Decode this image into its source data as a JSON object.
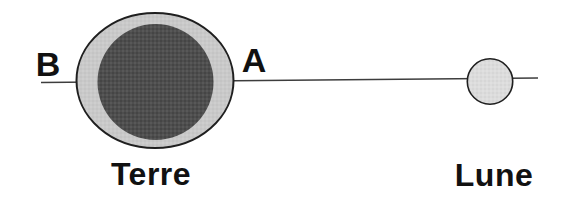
{
  "diagram": {
    "labels": {
      "point_b": "B",
      "point_a": "A",
      "earth": "Terre",
      "moon": "Lune"
    },
    "colors": {
      "background": "#ffffff",
      "earth_bulge_fill": "#c9c9c9",
      "earth_body_fill": "#4e4e4e",
      "moon_fill": "#dcdcdc",
      "outline": "#1f1f1f",
      "axis_line": "#3d3d3d",
      "text": "#111111"
    }
  }
}
